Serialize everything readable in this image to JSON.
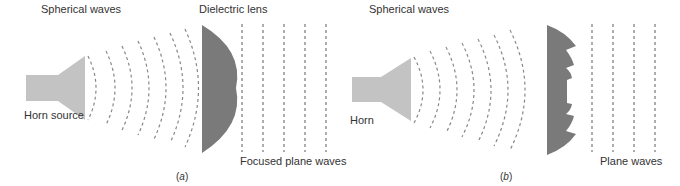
{
  "panel_a": {
    "label_spherical": "Spherical waves",
    "label_lens": "Dielectric lens",
    "label_source": "Horn source",
    "label_output": "Focused plane waves",
    "caption_open": "(",
    "caption_letter": "a",
    "caption_close": ")"
  },
  "panel_b": {
    "label_spherical": "Spherical waves",
    "label_source": "Horn",
    "label_output": "Plane waves",
    "caption_open": "(",
    "caption_letter": "b",
    "caption_close": ")"
  },
  "colors": {
    "horn": "#c3c3c3",
    "lens": "#7a7a7a",
    "wave": "#888888",
    "text": "#333333"
  }
}
